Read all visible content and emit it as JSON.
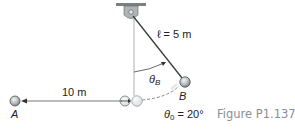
{
  "figure": {
    "caption": "Figure P1.137",
    "labels": {
      "length": "ℓ = 5 m",
      "theta_b": "θ",
      "theta_b_sub": "B",
      "point_b": "B",
      "distance": "10 m",
      "point_a": "A",
      "theta_0": "θ",
      "theta_0_sub": "0",
      "theta_0_value": " = 20°"
    },
    "colors": {
      "ball": "#b8bcbe",
      "line": "#555555",
      "caption": "#8a8f93"
    }
  }
}
